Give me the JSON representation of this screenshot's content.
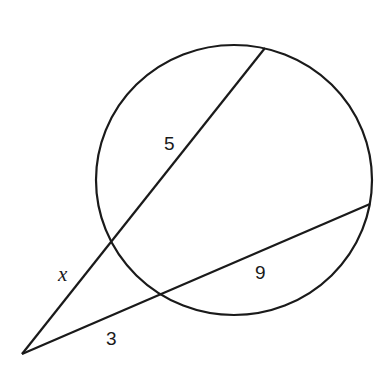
{
  "diagram": {
    "type": "circle with two secants from external point",
    "labels": {
      "secant1_internal": "5",
      "secant1_external": "x",
      "secant2_internal": "9",
      "secant2_external": "3"
    },
    "colors": {
      "stroke": "#1a1a1a",
      "background": "#ffffff"
    }
  }
}
